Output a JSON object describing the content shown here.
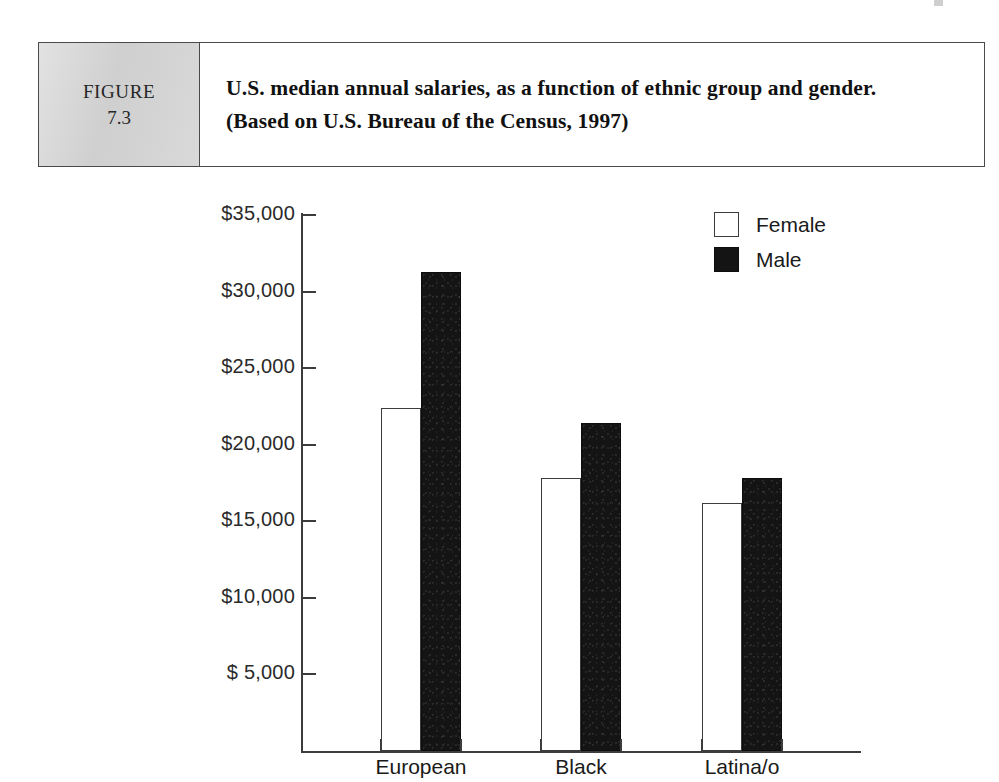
{
  "figure": {
    "tag_word": "FIGURE",
    "tag_number": "7.3",
    "caption": "U.S. median annual salaries, as a function of ethnic group and gender. (Based on U.S. Bureau of the Census, 1997)"
  },
  "chart_data": {
    "type": "bar",
    "title": "",
    "xlabel": "",
    "ylabel": "Median salary",
    "categories": [
      "European",
      "Black",
      "Latina/o"
    ],
    "series": [
      {
        "name": "Female",
        "color": "#ffffff",
        "values": [
          22400,
          17800,
          16200
        ]
      },
      {
        "name": "Male",
        "color": "#141414",
        "values": [
          31300,
          21400,
          17800
        ]
      }
    ],
    "ylim": [
      0,
      35000
    ],
    "y_ticks": [
      35000,
      30000,
      25000,
      20000,
      15000,
      10000,
      5000
    ],
    "y_tick_labels": [
      "$35,000",
      "$30,000",
      "$25,000",
      "$20,000",
      "$15,000",
      "$10,000",
      "$ 5,000"
    ],
    "grid": false,
    "legend_position": "top-right",
    "legend": [
      "Female",
      "Male"
    ]
  }
}
